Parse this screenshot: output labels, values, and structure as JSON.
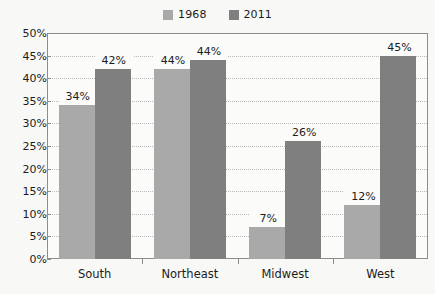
{
  "chart_data": {
    "type": "bar",
    "title": "",
    "subtitle": "",
    "xlabel": "",
    "ylabel": "",
    "categories": [
      "South",
      "Northeast",
      "Midwest",
      "West"
    ],
    "series": [
      {
        "name": "1968",
        "color": "#a9a9a9",
        "values": [
          34,
          42,
          7,
          12
        ]
      },
      {
        "name": "2011",
        "color": "#7f7f7f",
        "values": [
          42,
          44,
          26,
          45
        ]
      }
    ],
    "value_labels": [
      [
        "34%",
        "42%"
      ],
      [
        "44%",
        "44%"
      ],
      [
        "7%",
        "26%"
      ],
      [
        "12%",
        "45%"
      ]
    ],
    "ylim": [
      0,
      50
    ],
    "ytick_values": [
      0,
      5,
      10,
      15,
      20,
      25,
      30,
      35,
      40,
      45,
      50
    ],
    "ytick_labels": [
      "0%",
      "5%",
      "10%",
      "15%",
      "20%",
      "25%",
      "30%",
      "35%",
      "40%",
      "45%",
      "50%"
    ],
    "grid": true,
    "grid_style": "dotted",
    "legend_position": "top-center",
    "plot_border_color": "#8d8d8d",
    "plot_background": "#fbfbfa",
    "page_background": "#f8f8f6"
  },
  "legend": {
    "items": [
      {
        "label": "1968",
        "color": "#a9a9a9"
      },
      {
        "label": "2011",
        "color": "#7f7f7f"
      }
    ]
  }
}
